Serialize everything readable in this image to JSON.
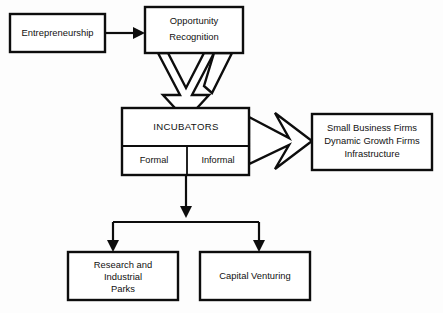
{
  "diagram": {
    "background_color": "#fdfdfd",
    "line_color": "#0d0d0d",
    "nodes": {
      "entrepreneurship": {
        "label": "Entrepreneurship"
      },
      "opportunity_recognition": {
        "line1": "Opportunity",
        "line2": "Recognition"
      },
      "incubators": {
        "title": "INCUBATORS",
        "formal": "Formal",
        "informal": "Informal"
      },
      "outcomes": {
        "line1": "Small Business Firms",
        "line2": "Dynamic Growth Firms",
        "line3": "Infrastructure"
      },
      "research_parks": {
        "line1": "Research and",
        "line2": "Industrial",
        "line3": "Parks"
      },
      "capital_venturing": {
        "label": "Capital Venturing"
      }
    },
    "connectors": {
      "entrepreneurship_to_opportunity": "arrow-right",
      "opportunity_to_incubators": "converging-down-arrow",
      "incubators_to_outcomes": "chevron-right-arrow",
      "incubators_to_research_parks": "arrow-down",
      "incubators_to_capital_venturing": "arrow-down"
    }
  }
}
